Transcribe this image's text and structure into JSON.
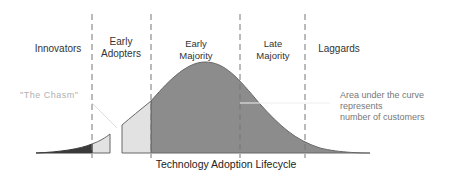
{
  "diagram": {
    "title": "Technology Adoption Lifecycle",
    "segments": [
      {
        "id": "innovators",
        "label_lines": [
          "Innovators"
        ],
        "x": 58,
        "top": 43
      },
      {
        "id": "early-adopters",
        "label_lines": [
          "Early",
          "Adopters"
        ],
        "x": 121,
        "top": 36
      },
      {
        "id": "early-majority",
        "label_lines": [
          "Early",
          "Majority"
        ],
        "x": 196,
        "top": 38
      },
      {
        "id": "late-majority",
        "label_lines": [
          "Late",
          "Majority"
        ],
        "x": 273,
        "top": 38
      },
      {
        "id": "laggards",
        "label_lines": [
          "Laggards"
        ],
        "x": 322,
        "top": 43
      }
    ],
    "label_line_0": {
      "innovators": "Innovators",
      "early_adopters": "Early",
      "early_majority": "Early",
      "late_majority": "Late",
      "laggards": "Laggards"
    },
    "label_line_1": {
      "early_adopters": "Adopters",
      "early_majority": "Majority",
      "late_majority": "Majority"
    },
    "chasm_label": "\"The Chasm\"",
    "note_lines": [
      "Area under the curve",
      "represents",
      "number of customers"
    ],
    "divider_x": [
      92,
      151,
      240,
      305
    ],
    "colors": {
      "innovators_fill": "#3a3a3a",
      "early_adopters_fill": "#e2e2e2",
      "majority_fill": "#8c8c8c",
      "outline": "#666666",
      "divider": "#777777",
      "chasm_text": "#b0b0b0"
    }
  }
}
